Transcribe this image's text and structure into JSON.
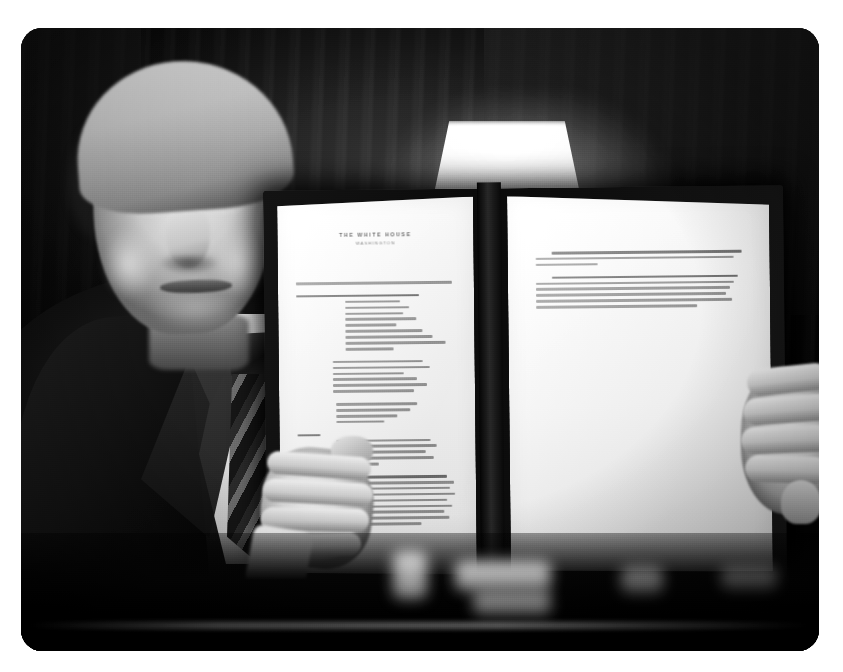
{
  "photo": {
    "kind": "photograph",
    "color_mode": "black-and-white",
    "scene_description": "A man in a dark suit, white shirt and striped necktie holds up an opened dark leather presidential portfolio displaying a signed typed document; a lit lamp shade glows behind him in a dim room.",
    "alt_text": "Man in dark suit holding up a signed document in a leather folder",
    "background": {
      "setting": "dim room with drapery and a lit table lamp",
      "lamp": "lamp-shade"
    },
    "subject": {
      "expression": "serious, lips pursed",
      "hair": "light swept-back hair",
      "attire": {
        "suit": "dark suit jacket",
        "shirt": "white dress shirt",
        "tie": "diagonally striped necktie"
      },
      "pose": "both hands gripping the open folder, held up toward the camera"
    },
    "document": {
      "folder": "dark leather portfolio",
      "letterhead_title": "THE WHITE HOUSE",
      "letterhead_subtitle": "WASHINGTON",
      "left_page": {
        "label": "typed-document-page",
        "text_legible": false,
        "paragraph_line_counts": [
          1,
          9,
          7,
          4,
          5,
          9
        ]
      },
      "right_page": {
        "label": "signed-page",
        "text_legible": false,
        "paragraph_line_counts": [
          3,
          6
        ],
        "signature": "Donald J. Trump"
      }
    },
    "foreground": {
      "description": "blurred bright objects on a desk edge across the bottom"
    },
    "frame": {
      "corner_radius_px": 21,
      "background_color": "#ffffff",
      "photo_color_dark": "#0a0a0a",
      "photo_color_light": "#fdfdfb"
    }
  }
}
